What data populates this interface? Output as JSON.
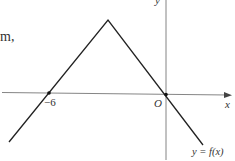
{
  "fragment_text": "m,",
  "axes": {
    "x_label": "x",
    "y_label": "y",
    "origin_label": "O"
  },
  "points": {
    "x_intercept_label": "−6"
  },
  "curve_label": "y = f(x)",
  "colors": {
    "line": "#222222",
    "axis": "#555555",
    "text": "#333333"
  }
}
